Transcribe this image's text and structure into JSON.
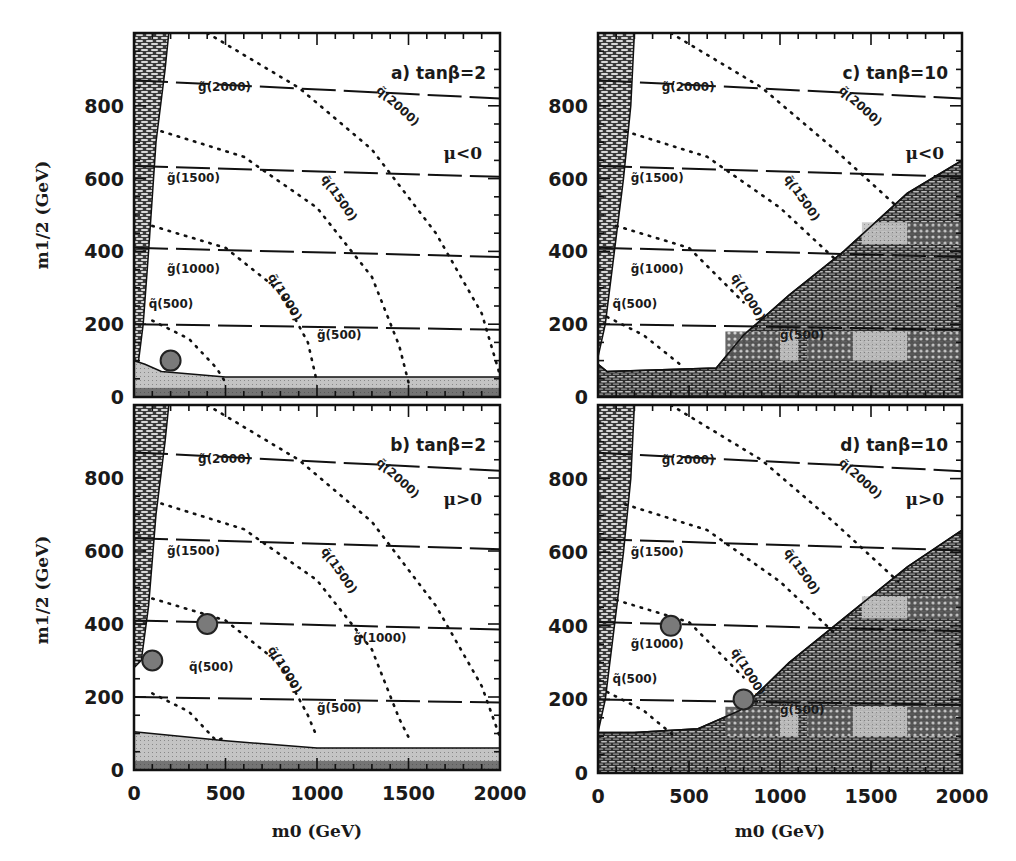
{
  "chart_data": {
    "type": "contour",
    "layout": "2x2 grid",
    "shared_xlabel": "m0 (GeV)",
    "shared_ylabel": "m1/2 (GeV)",
    "xlim": [
      0,
      2000
    ],
    "ylim": [
      0,
      1000
    ],
    "x_ticks": [
      0,
      500,
      1000,
      1500,
      2000
    ],
    "y_ticks": [
      0,
      200,
      400,
      600,
      800
    ],
    "grid": false,
    "legend": "none (inline contour labels)",
    "panels": [
      {
        "id": "a",
        "label": "a) tanβ=2",
        "sign_mu": "μ<0",
        "gluino_contours": [
          {
            "label": "g̃(500)",
            "mass": 500,
            "points": [
              [
                0,
                200
              ],
              [
                2000,
                185
              ]
            ]
          },
          {
            "label": "g̃(1000)",
            "mass": 1000,
            "points": [
              [
                0,
                410
              ],
              [
                2000,
                385
              ]
            ]
          },
          {
            "label": "g̃(1500)",
            "mass": 1500,
            "points": [
              [
                0,
                635
              ],
              [
                2000,
                605
              ]
            ]
          },
          {
            "label": "g̃(2000)",
            "mass": 2000,
            "points": [
              [
                0,
                870
              ],
              [
                2000,
                820
              ]
            ]
          }
        ],
        "squark_contours": [
          {
            "label": "q̃(500)",
            "mass": 500,
            "points": [
              [
                100,
                210
              ],
              [
                300,
                160
              ],
              [
                450,
                80
              ],
              [
                500,
                40
              ]
            ]
          },
          {
            "label": "q̃(1000)",
            "mass": 1000,
            "points": [
              [
                100,
                470
              ],
              [
                500,
                410
              ],
              [
                800,
                290
              ],
              [
                950,
                150
              ],
              [
                1000,
                40
              ]
            ]
          },
          {
            "label": "q̃(1500)",
            "mass": 1500,
            "points": [
              [
                150,
                730
              ],
              [
                600,
                660
              ],
              [
                1000,
                520
              ],
              [
                1300,
                330
              ],
              [
                1450,
                140
              ],
              [
                1500,
                40
              ]
            ]
          },
          {
            "label": "q̃(2000)",
            "mass": 2000,
            "points": [
              [
                400,
                1000
              ],
              [
                900,
                850
              ],
              [
                1300,
                680
              ],
              [
                1650,
                450
              ],
              [
                1900,
                230
              ],
              [
                2000,
                60
              ]
            ]
          }
        ],
        "excluded_regions": [
          {
            "name": "left-band (theoretically excluded)",
            "points": [
              [
                0,
                0
              ],
              [
                0,
                1000
              ],
              [
                190,
                1000
              ],
              [
                170,
                900
              ],
              [
                120,
                700
              ],
              [
                80,
                400
              ],
              [
                50,
                200
              ],
              [
                20,
                80
              ],
              [
                0,
                60
              ]
            ]
          },
          {
            "name": "bottom-band (experimentally excluded)",
            "points": [
              [
                0,
                0
              ],
              [
                2000,
                0
              ],
              [
                2000,
                55
              ],
              [
                1000,
                55
              ],
              [
                500,
                55
              ],
              [
                150,
                70
              ],
              [
                60,
                90
              ],
              [
                0,
                100
              ]
            ]
          }
        ],
        "benchmark_points": [
          {
            "m0": 200,
            "m12": 100
          }
        ]
      },
      {
        "id": "b",
        "label": "b) tanβ=2",
        "sign_mu": "μ>0",
        "gluino_contours": [
          {
            "label": "g̃(500)",
            "mass": 500,
            "points": [
              [
                0,
                200
              ],
              [
                2000,
                185
              ]
            ]
          },
          {
            "label": "g̃(1000)",
            "mass": 1000,
            "points": [
              [
                0,
                410
              ],
              [
                2000,
                385
              ]
            ]
          },
          {
            "label": "g̃(1500)",
            "mass": 1500,
            "points": [
              [
                0,
                635
              ],
              [
                2000,
                605
              ]
            ]
          },
          {
            "label": "g̃(2000)",
            "mass": 2000,
            "points": [
              [
                0,
                870
              ],
              [
                2000,
                820
              ]
            ]
          }
        ],
        "squark_contours": [
          {
            "label": "q̃(500)",
            "mass": 500,
            "points": [
              [
                100,
                210
              ],
              [
                300,
                160
              ],
              [
                450,
                80
              ],
              [
                500,
                90
              ]
            ]
          },
          {
            "label": "q̃(1000)",
            "mass": 1000,
            "points": [
              [
                100,
                470
              ],
              [
                500,
                410
              ],
              [
                800,
                290
              ],
              [
                950,
                150
              ],
              [
                1000,
                90
              ]
            ]
          },
          {
            "label": "q̃(1500)",
            "mass": 1500,
            "points": [
              [
                150,
                730
              ],
              [
                600,
                660
              ],
              [
                1000,
                520
              ],
              [
                1300,
                330
              ],
              [
                1450,
                140
              ],
              [
                1500,
                90
              ]
            ]
          },
          {
            "label": "q̃(2000)",
            "mass": 2000,
            "points": [
              [
                400,
                1000
              ],
              [
                900,
                850
              ],
              [
                1300,
                680
              ],
              [
                1650,
                450
              ],
              [
                1900,
                230
              ],
              [
                2000,
                90
              ]
            ]
          }
        ],
        "excluded_regions": [
          {
            "name": "left-band (theoretically excluded)",
            "points": [
              [
                0,
                0
              ],
              [
                0,
                1000
              ],
              [
                190,
                1000
              ],
              [
                170,
                900
              ],
              [
                120,
                700
              ],
              [
                80,
                450
              ],
              [
                40,
                300
              ],
              [
                0,
                280
              ]
            ]
          },
          {
            "name": "bottom-band (experimentally excluded)",
            "points": [
              [
                0,
                0
              ],
              [
                2000,
                0
              ],
              [
                2000,
                60
              ],
              [
                1000,
                60
              ],
              [
                500,
                80
              ],
              [
                0,
                105
              ]
            ]
          }
        ],
        "benchmark_points": [
          {
            "m0": 100,
            "m12": 300
          },
          {
            "m0": 400,
            "m12": 400
          }
        ]
      },
      {
        "id": "c",
        "label": "c) tanβ=10",
        "sign_mu": "μ<0",
        "gluino_contours": [
          {
            "label": "g̃(500)",
            "mass": 500,
            "points": [
              [
                0,
                200
              ],
              [
                2000,
                185
              ]
            ]
          },
          {
            "label": "g̃(1000)",
            "mass": 1000,
            "points": [
              [
                0,
                410
              ],
              [
                2000,
                385
              ]
            ]
          },
          {
            "label": "g̃(1500)",
            "mass": 1500,
            "points": [
              [
                0,
                635
              ],
              [
                2000,
                605
              ]
            ]
          },
          {
            "label": "g̃(2000)",
            "mass": 2000,
            "points": [
              [
                0,
                870
              ],
              [
                2000,
                820
              ]
            ]
          }
        ],
        "squark_contours": [
          {
            "label": "q̃(500)",
            "mass": 500,
            "points": [
              [
                50,
                220
              ],
              [
                250,
                170
              ],
              [
                450,
                90
              ]
            ]
          },
          {
            "label": "q̃(1000)",
            "mass": 1000,
            "points": [
              [
                100,
                470
              ],
              [
                500,
                410
              ],
              [
                800,
                260
              ]
            ]
          },
          {
            "label": "q̃(1500)",
            "mass": 1500,
            "points": [
              [
                150,
                730
              ],
              [
                600,
                660
              ],
              [
                1000,
                520
              ],
              [
                1300,
                380
              ]
            ]
          },
          {
            "label": "q̃(2000)",
            "mass": 2000,
            "points": [
              [
                400,
                1000
              ],
              [
                900,
                850
              ],
              [
                1300,
                680
              ],
              [
                1650,
                520
              ]
            ]
          }
        ],
        "excluded_regions": [
          {
            "name": "left-band (theoretically excluded)",
            "points": [
              [
                0,
                0
              ],
              [
                0,
                1000
              ],
              [
                200,
                1000
              ],
              [
                180,
                800
              ],
              [
                140,
                600
              ],
              [
                90,
                400
              ],
              [
                40,
                200
              ],
              [
                0,
                110
              ]
            ]
          },
          {
            "name": "bottom-right wedge (no EWSB / LSP excluded)",
            "points": [
              [
                0,
                0
              ],
              [
                0,
                90
              ],
              [
                50,
                70
              ],
              [
                650,
                80
              ],
              [
                800,
                170
              ],
              [
                1050,
                280
              ],
              [
                1350,
                400
              ],
              [
                1700,
                560
              ],
              [
                2000,
                650
              ],
              [
                2000,
                0
              ]
            ]
          }
        ],
        "benchmark_points": []
      },
      {
        "id": "d",
        "label": "d) tanβ=10",
        "sign_mu": "μ>0",
        "gluino_contours": [
          {
            "label": "g̃(500)",
            "mass": 500,
            "points": [
              [
                0,
                200
              ],
              [
                2000,
                185
              ]
            ]
          },
          {
            "label": "g̃(1000)",
            "mass": 1000,
            "points": [
              [
                0,
                410
              ],
              [
                2000,
                385
              ]
            ]
          },
          {
            "label": "g̃(1500)",
            "mass": 1500,
            "points": [
              [
                0,
                635
              ],
              [
                2000,
                605
              ]
            ]
          },
          {
            "label": "g̃(2000)",
            "mass": 2000,
            "points": [
              [
                0,
                870
              ],
              [
                2000,
                820
              ]
            ]
          }
        ],
        "squark_contours": [
          {
            "label": "q̃(500)",
            "mass": 500,
            "points": [
              [
                50,
                220
              ],
              [
                250,
                170
              ],
              [
                420,
                100
              ]
            ]
          },
          {
            "label": "q̃(1000)",
            "mass": 1000,
            "points": [
              [
                100,
                470
              ],
              [
                500,
                410
              ],
              [
                800,
                260
              ]
            ]
          },
          {
            "label": "q̃(1500)",
            "mass": 1500,
            "points": [
              [
                150,
                730
              ],
              [
                600,
                660
              ],
              [
                1000,
                520
              ],
              [
                1300,
                380
              ]
            ]
          },
          {
            "label": "q̃(2000)",
            "mass": 2000,
            "points": [
              [
                400,
                1000
              ],
              [
                900,
                850
              ],
              [
                1300,
                680
              ],
              [
                1650,
                520
              ]
            ]
          }
        ],
        "excluded_regions": [
          {
            "name": "left-band (theoretically excluded)",
            "points": [
              [
                0,
                0
              ],
              [
                0,
                1000
              ],
              [
                200,
                1000
              ],
              [
                180,
                800
              ],
              [
                140,
                600
              ],
              [
                90,
                400
              ],
              [
                40,
                200
              ],
              [
                0,
                110
              ]
            ]
          },
          {
            "name": "bottom-right wedge (no EWSB / LSP excluded)",
            "points": [
              [
                0,
                0
              ],
              [
                0,
                110
              ],
              [
                200,
                110
              ],
              [
                550,
                120
              ],
              [
                780,
                170
              ],
              [
                1050,
                300
              ],
              [
                1350,
                420
              ],
              [
                1700,
                560
              ],
              [
                2000,
                660
              ],
              [
                2000,
                0
              ]
            ]
          }
        ],
        "benchmark_points": [
          {
            "m0": 400,
            "m12": 400
          },
          {
            "m0": 800,
            "m12": 200
          }
        ]
      }
    ]
  },
  "figure": {
    "x_axis_title": "m0 (GeV)",
    "y_axis_title": "m1/2 (GeV)",
    "x_tick_labels": [
      "0",
      "500",
      "1000",
      "1500",
      "2000"
    ],
    "y_tick_labels": [
      "0",
      "200",
      "400",
      "600",
      "800"
    ]
  }
}
